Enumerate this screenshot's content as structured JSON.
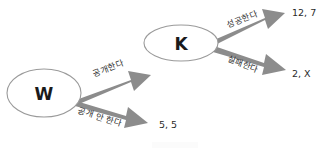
{
  "diagram": {
    "type": "game-tree",
    "background_color": "#ffffff",
    "node_stroke_color": "#9a9a9a",
    "arrow_color": "#8c8c8c",
    "text_color": "#2e2e2e",
    "nodes": [
      {
        "id": "w",
        "label": "W",
        "cx": 44,
        "cy": 93,
        "rx": 37,
        "ry": 24
      },
      {
        "id": "k",
        "label": "K",
        "cx": 181,
        "cy": 43,
        "rx": 37,
        "ry": 18
      }
    ],
    "edges": [
      {
        "id": "edge-disclose",
        "from": "W",
        "to": "K",
        "label": "공개한다",
        "label_x": 108,
        "label_y": 68,
        "label_rotation": -21
      },
      {
        "id": "edge-not-disclose",
        "from": "W",
        "to": "payoff-5-5",
        "label": "공개 안 한다",
        "label_x": 100,
        "label_y": 117,
        "label_rotation": 18
      },
      {
        "id": "edge-success",
        "from": "K",
        "to": "payoff-12-7",
        "label": "성공한다",
        "label_x": 242,
        "label_y": 19,
        "label_rotation": -22
      },
      {
        "id": "edge-failure",
        "from": "K",
        "to": "payoff-2-x",
        "label": "실패한다",
        "label_x": 243,
        "label_y": 64,
        "label_rotation": 20
      }
    ],
    "payoffs": [
      {
        "id": "payoff-12-7",
        "text": "12, 7",
        "x": 292,
        "y": 12
      },
      {
        "id": "payoff-2-x",
        "text": "2, X",
        "x": 292,
        "y": 73
      },
      {
        "id": "payoff-5-5",
        "text": "5, 5",
        "x": 159,
        "y": 124
      }
    ]
  }
}
